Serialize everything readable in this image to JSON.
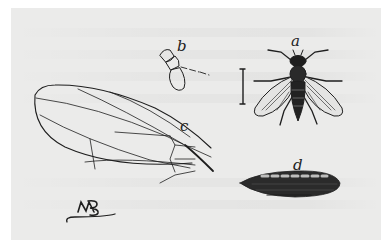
{
  "plate": {
    "background": "#ebebea",
    "ink": "#1e1e1e",
    "figures": [
      {
        "id": "a",
        "label": "a",
        "subject": "adult fly (dorsal view)",
        "has_scale_bar": true
      },
      {
        "id": "b",
        "label": "b",
        "subject": "antenna detail"
      },
      {
        "id": "c",
        "label": "c",
        "subject": "wing venation"
      },
      {
        "id": "d",
        "label": "d",
        "subject": "pupa / puparium",
        "has_scale_bar": true
      }
    ],
    "monogram": "MP"
  }
}
